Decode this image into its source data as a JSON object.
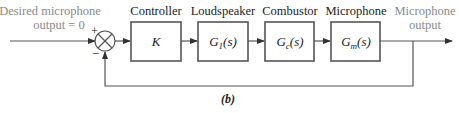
{
  "diagram": {
    "input_label_line1": "Desired microphone",
    "input_label_line2": "output = 0",
    "sum_plus": "+",
    "sum_minus": "−",
    "blocks": [
      {
        "title": "Controller",
        "tf_main": "K",
        "tf_sub": "",
        "tf_tail": ""
      },
      {
        "title": "Loudspeaker",
        "tf_main": "G",
        "tf_sub": "1",
        "tf_tail": "(s)"
      },
      {
        "title": "Combustor",
        "tf_main": "G",
        "tf_sub": "c",
        "tf_tail": "(s)"
      },
      {
        "title": "Microphone",
        "tf_main": "G",
        "tf_sub": "m",
        "tf_tail": "(s)"
      }
    ],
    "output_label_line1": "Microphone",
    "output_label_line2": "output",
    "caption": "(b)",
    "colors": {
      "line": "#555555",
      "text": "#222222",
      "signal_label": "#8a8a8a"
    }
  }
}
